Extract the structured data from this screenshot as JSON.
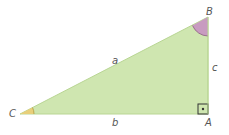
{
  "diagram": {
    "type": "right-triangle",
    "colors": {
      "fill": "#cfe6b0",
      "stroke": "#b9d694",
      "angle_B": "#c89bc0",
      "angle_C": "#e8cf7a",
      "right_angle_mark": "#333333",
      "label": "#555555"
    },
    "vertices": [
      {
        "name": "C",
        "label": "C"
      },
      {
        "name": "A",
        "label": "A"
      },
      {
        "name": "B",
        "label": "B"
      }
    ],
    "sides": [
      {
        "name": "a",
        "label": "a"
      },
      {
        "name": "b",
        "label": "b"
      },
      {
        "name": "c",
        "label": "c"
      }
    ]
  }
}
